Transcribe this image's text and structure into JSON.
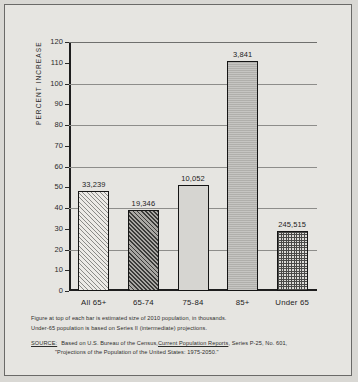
{
  "figure": {
    "y_axis_title": "PERCENT INCREASE",
    "notes": [
      "Figure at top of each bar is estimated size of 2010 population, in thousands.",
      "Under-65 population is based on Series II (intermediate) projections."
    ],
    "source": {
      "label": "SOURCE:",
      "line1_pre": "Based on U.S. Bureau of the Census, ",
      "line1_italic": "Current Population Reports",
      "line1_post": ", Series P-25, No. 601,",
      "line2": "\"Projections of the Population of the United States: 1975-2050.\""
    }
  },
  "chart_data": {
    "type": "bar",
    "title": "",
    "xlabel": "",
    "ylabel": "PERCENT INCREASE",
    "ylim": [
      0,
      120
    ],
    "ytick_step": 10,
    "gridline_step": 20,
    "grid": true,
    "legend": "none",
    "categories": [
      "All 65+",
      "65-74",
      "75-84",
      "85+",
      "Under 65"
    ],
    "values": [
      48,
      39,
      51,
      111,
      29
    ],
    "bar_labels": [
      "33,239",
      "19,346",
      "10,052",
      "3,841",
      "245,515"
    ],
    "bar_label_note": "estimated size of 2010 population, in thousands",
    "yticks": [
      "0",
      "10",
      "20",
      "30",
      "40",
      "50",
      "60",
      "70",
      "80",
      "90",
      "100",
      "110",
      "120"
    ],
    "fills": [
      "diagonal-hatch-light",
      "diagonal-hatch-dark",
      "solid-light-gray",
      "solid-mid-gray",
      "stipple-grid"
    ]
  }
}
